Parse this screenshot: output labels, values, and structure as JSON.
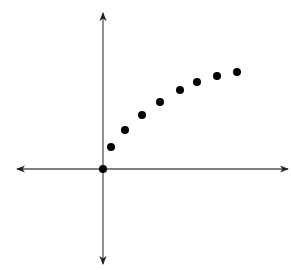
{
  "chart_data": {
    "type": "scatter",
    "title": "",
    "xlabel": "",
    "ylabel": "",
    "grid": false,
    "legend": null,
    "axes": {
      "x_range": [
        -4.3,
        9.25
      ],
      "y_range": [
        -4.75,
        7.8
      ],
      "arrows": true,
      "tick_labels": false
    },
    "series": [
      {
        "name": "points",
        "color": "#000000",
        "x": [
          0,
          0.4,
          1.1,
          1.95,
          2.85,
          3.85,
          4.7,
          5.7,
          6.7
        ],
        "y": [
          0,
          1.1,
          1.95,
          2.7,
          3.35,
          3.95,
          4.35,
          4.65,
          4.85
        ]
      }
    ]
  },
  "layout": {
    "origin_px": [
      103,
      169
    ],
    "unit_px": 20,
    "x_axis_px": [
      17,
      288
    ],
    "y_axis_px": [
      13,
      264
    ],
    "axis_color": "#555555",
    "point_color": "#000000",
    "point_radius": 4
  }
}
